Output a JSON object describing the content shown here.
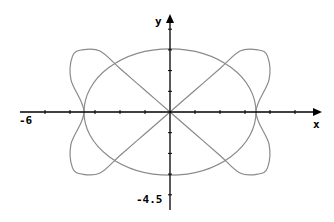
{
  "chart_data": {
    "type": "line",
    "title": "",
    "xlabel": "x",
    "ylabel": "y",
    "x_min_label": "-6",
    "y_min_label": "-4.5",
    "xlim": [
      -6,
      6
    ],
    "ylim": [
      -4.5,
      4.5
    ],
    "grid": false,
    "legend": null,
    "x_ticks": [
      -5,
      -4,
      -3,
      -2,
      -1,
      1,
      2,
      3,
      4,
      5
    ],
    "y_ticks": [
      -4,
      -3,
      -2,
      -1,
      1,
      2,
      3,
      4
    ],
    "series": [
      {
        "name": "ellipse",
        "description": "closed ellipse centered at origin",
        "center": [
          0,
          0
        ],
        "rx": 3.44,
        "ry": 3.05
      },
      {
        "name": "butterfly-lobes",
        "description": "closed curve through origin forming two lobes",
        "points": [
          [
            0,
            0
          ],
          [
            1.0,
            1.05
          ],
          [
            2.0,
            2.1
          ],
          [
            2.8,
            2.95
          ],
          [
            3.52,
            3.0
          ],
          [
            3.9,
            2.7
          ],
          [
            3.96,
            1.55
          ],
          [
            3.44,
            0
          ],
          [
            3.96,
            -1.55
          ],
          [
            3.9,
            -2.7
          ],
          [
            3.52,
            -3.0
          ],
          [
            2.8,
            -2.95
          ],
          [
            2.0,
            -2.1
          ],
          [
            1.0,
            -1.05
          ],
          [
            0,
            0
          ],
          [
            -1.0,
            1.05
          ],
          [
            -2.0,
            2.1
          ],
          [
            -2.8,
            2.95
          ],
          [
            -3.52,
            3.0
          ],
          [
            -3.9,
            2.7
          ],
          [
            -3.96,
            1.55
          ],
          [
            -3.44,
            0
          ],
          [
            -3.96,
            -1.55
          ],
          [
            -3.9,
            -2.7
          ],
          [
            -3.52,
            -3.0
          ],
          [
            -2.8,
            -2.95
          ],
          [
            -2.0,
            -2.1
          ],
          [
            -1.0,
            -1.05
          ],
          [
            0,
            0
          ]
        ]
      }
    ],
    "colors": {
      "curve": "#8a8a8a",
      "axes": "#000000"
    }
  }
}
